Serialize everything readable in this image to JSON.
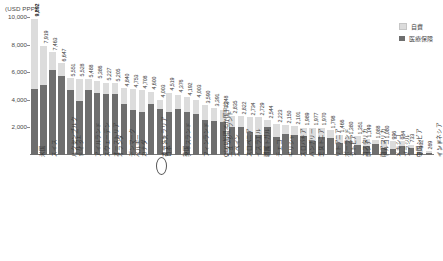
{
  "axis_unit": "(USD PPP)",
  "legend": {
    "self_pay": "自費",
    "insurance": "医療保険",
    "color_self_pay": "#dcdcdc",
    "color_insurance": "#6e6e6e"
  },
  "highlight_label": "日本",
  "chart_data": {
    "type": "bar",
    "title": "",
    "subtitle": "",
    "xlabel": "",
    "ylabel": "(USD PPP)",
    "ylim": [
      0,
      10000
    ],
    "yticks": [
      "10,000",
      "8,000",
      "6,000",
      "4,000",
      "2,000"
    ],
    "ytick_values": [
      10000,
      8000,
      6000,
      4000,
      2000
    ],
    "grid": false,
    "legend_position": "top-right",
    "stacked": true,
    "series": [
      {
        "name": "医療保険",
        "color": "#6e6e6e"
      },
      {
        "name": "自費",
        "color": "#dcdcdc"
      }
    ],
    "categories": [
      "米国",
      "スイス",
      "ルクセンブルク",
      "ノルウェー",
      "ドイツ",
      "アイルランド",
      "スウェーデン",
      "オーストリア",
      "オランダ",
      "デンマーク",
      "ベルギー",
      "カナダ",
      "オーストラリア",
      "フランス",
      "日本",
      "アイスランド",
      "英国",
      "フィンランド",
      "OECD加盟35か国平均",
      "ニュージーランド",
      "イタリア",
      "スペイン",
      "スロベニア",
      "イスラエル",
      "ポルトガル",
      "韓国",
      "チェコ",
      "ギリシャ",
      "スロバキア",
      "ハンガリー",
      "エストニア",
      "チリ",
      "リトアニア",
      "ポーランド",
      "ラトビア",
      "コスタリカ",
      "ロシア",
      "南アフリカ",
      "トルコ",
      "メキシコ",
      "ブラジル",
      "コロンビア",
      "中国",
      "インドネシア",
      "インド"
    ],
    "values": [
      9892,
      7919,
      7463,
      6647,
      5551,
      5528,
      5488,
      5386,
      5227,
      5205,
      4840,
      4753,
      4708,
      4600,
      4003,
      4519,
      4376,
      4192,
      4003,
      3590,
      3391,
      3248,
      2835,
      2822,
      2734,
      2729,
      2544,
      2223,
      2150,
      2101,
      1989,
      1977,
      1970,
      1798,
      1466,
      1380,
      1351,
      1149,
      1088,
      1080,
      996,
      984,
      733,
      302,
      269
    ],
    "insurance_values": [
      4780,
      5040,
      6150,
      5700,
      4680,
      3890,
      4680,
      4530,
      4420,
      4420,
      3680,
      3250,
      3140,
      3730,
      3370,
      3100,
      3370,
      3120,
      2950,
      2560,
      2470,
      2380,
      2020,
      2020,
      1640,
      1420,
      2010,
      1300,
      1530,
      1480,
      1390,
      1000,
      1310,
      1240,
      840,
      1020,
      760,
      680,
      820,
      480,
      470,
      620,
      480,
      130,
      170
    ],
    "labels": [
      "9,892",
      "7,919",
      "7,463",
      "6,647",
      "5,551",
      "5,528",
      "5,488",
      "5,386",
      "5,227",
      "5,205",
      "4,840",
      "4,753",
      "4,708",
      "4,600",
      "4,003",
      "4,519",
      "4,376",
      "4,192",
      "4,003",
      "3,590",
      "3,391",
      "3,248",
      "2,835",
      "2,822",
      "2,734",
      "2,729",
      "2,544",
      "2,223",
      "2,150",
      "2,101",
      "1,989",
      "1,977",
      "1,970",
      "1,798",
      "1,466",
      "1,380",
      "1,351",
      "1,149",
      "1,088",
      "1,080",
      "996",
      "984",
      "733",
      "302",
      "269"
    ],
    "highlight_index": 14
  }
}
